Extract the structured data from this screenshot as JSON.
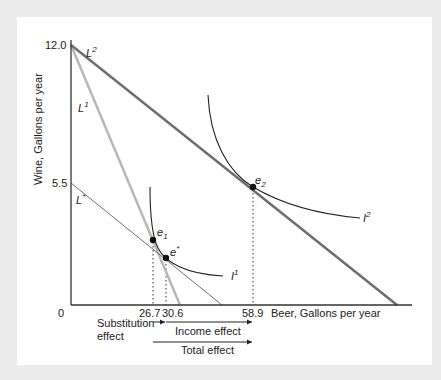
{
  "diagram": {
    "axes": {
      "y_label": "Wine, Gallons per year",
      "x_label": "Beer, Gallons per year",
      "origin_label": "0",
      "y_ticks": [
        "12.0",
        "5.5"
      ],
      "x_ticks": [
        "26.7",
        "30.6",
        "58.9"
      ]
    },
    "lines": {
      "L2": {
        "base": "L",
        "sup": "2",
        "color": "#6e6e6e"
      },
      "L1": {
        "base": "L",
        "sup": "1",
        "color": "#b8b8b8"
      },
      "Lstar": {
        "base": "L",
        "sup": "*",
        "color": "#6e6e6e"
      }
    },
    "curves": {
      "I1": {
        "base": "I",
        "sup": "1"
      },
      "I2": {
        "base": "I",
        "sup": "2"
      }
    },
    "points": {
      "e1": {
        "base": "e",
        "sub": "1"
      },
      "estar": {
        "base": "e",
        "sup": "*"
      },
      "e2": {
        "base": "e",
        "sub": "2"
      }
    },
    "effects": {
      "substitution_line1": "Substitution",
      "substitution_line2": "effect",
      "income": "Income effect",
      "total": "Total effect"
    }
  }
}
